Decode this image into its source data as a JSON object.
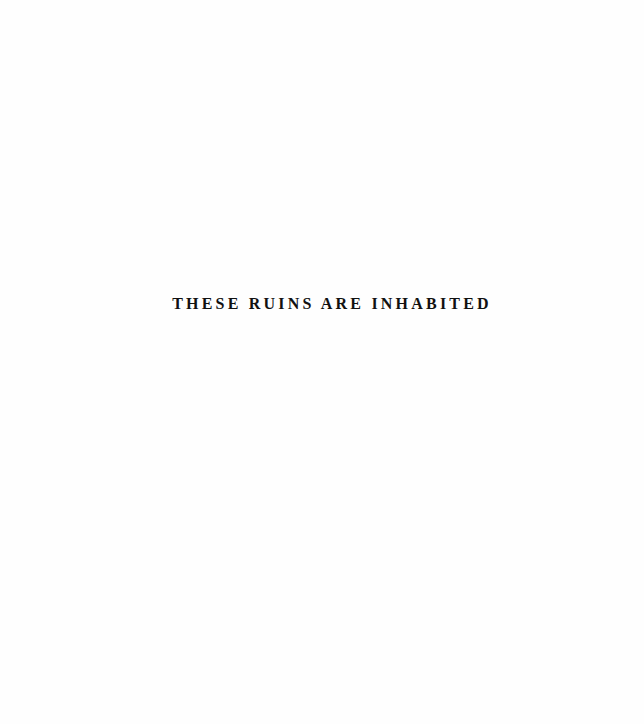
{
  "page": {
    "type": "half-title",
    "background_color": "#ffffff",
    "text_color": "#111111"
  },
  "half_title": {
    "text": "THESE RUINS ARE INHABITED"
  }
}
